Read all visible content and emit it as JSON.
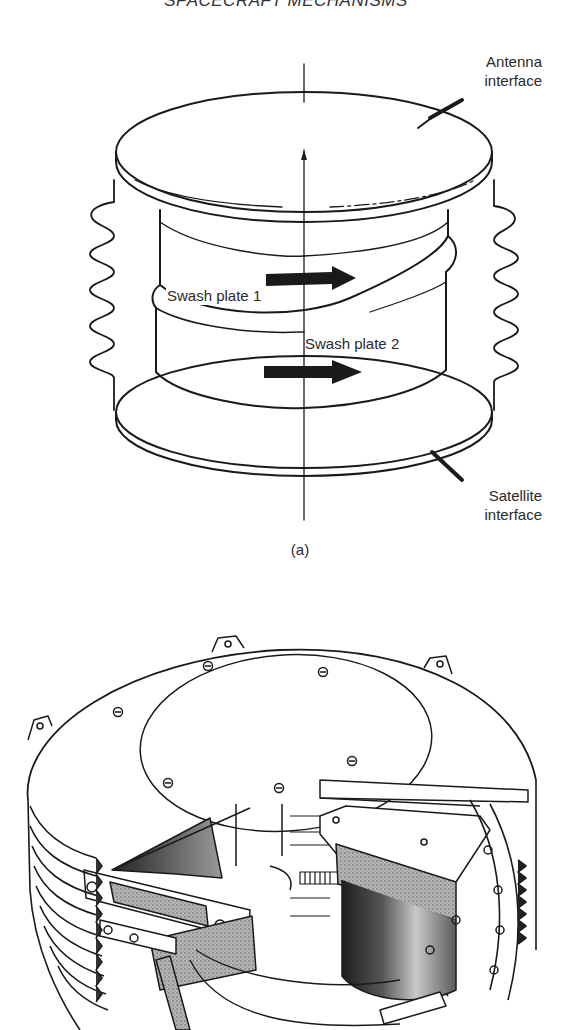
{
  "page": {
    "running_header": "SPACECRAFT MECHANISMS",
    "running_header_visibility": "partially cropped at top edge"
  },
  "figure_a": {
    "sublabel": "(a)",
    "description": "Schematic of a two-swash-plate antenna pointing mechanism between two interface plates, with flexible bellows on each side",
    "callouts": {
      "antenna_interface_line1": "Antenna",
      "antenna_interface_line2": "interface",
      "swash_plate_1": "Swash plate 1",
      "swash_plate_2": "Swash plate 2",
      "satellite_interface_line1": "Satellite",
      "satellite_interface_line2": "interface"
    },
    "arrows": [
      {
        "name": "swash-plate-1-rotation",
        "direction": "right"
      },
      {
        "name": "swash-plate-2-rotation",
        "direction": "right"
      }
    ],
    "colors": {
      "ink": "#1a1a1a",
      "paper": "#ffffff"
    }
  },
  "figure_b": {
    "description": "Cutaway line drawing of the swash-plate mechanism hardware: cylindrical housing with circular top cover plate (6 screws), mounting tabs, D-sub connector, motor cylinder, gear rings and corrugated bellows on the left side",
    "top_cover_screws": 6,
    "mounting_tabs_visible": 4,
    "colors": {
      "ink": "#1a1a1a",
      "shading": "#6a6a6a",
      "dark_shading": "#2b2b2b"
    }
  }
}
